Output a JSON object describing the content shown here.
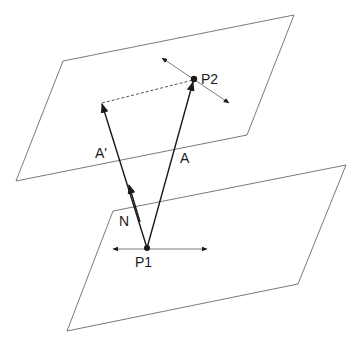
{
  "diagram": {
    "colors": {
      "plane_stroke": "#6a6a6a",
      "vector": "#1a1a1a",
      "tangent": "#7a7a7a",
      "background": "#ffffff"
    },
    "labels": {
      "p1": "P1",
      "p2": "P2",
      "a": "A",
      "a_prime": "A'",
      "n": "N"
    },
    "planes": [
      {
        "name": "upper-plane",
        "points": [
          [
            63,
            61
          ],
          [
            294,
            15
          ],
          [
            247,
            135
          ],
          [
            16,
            181
          ]
        ]
      },
      {
        "name": "lower-plane",
        "points": [
          [
            113,
            211
          ],
          [
            346,
            165
          ],
          [
            298,
            284
          ],
          [
            67,
            331
          ]
        ]
      }
    ],
    "points": {
      "p1": [
        147,
        248
      ],
      "p2": [
        194,
        79
      ]
    }
  }
}
